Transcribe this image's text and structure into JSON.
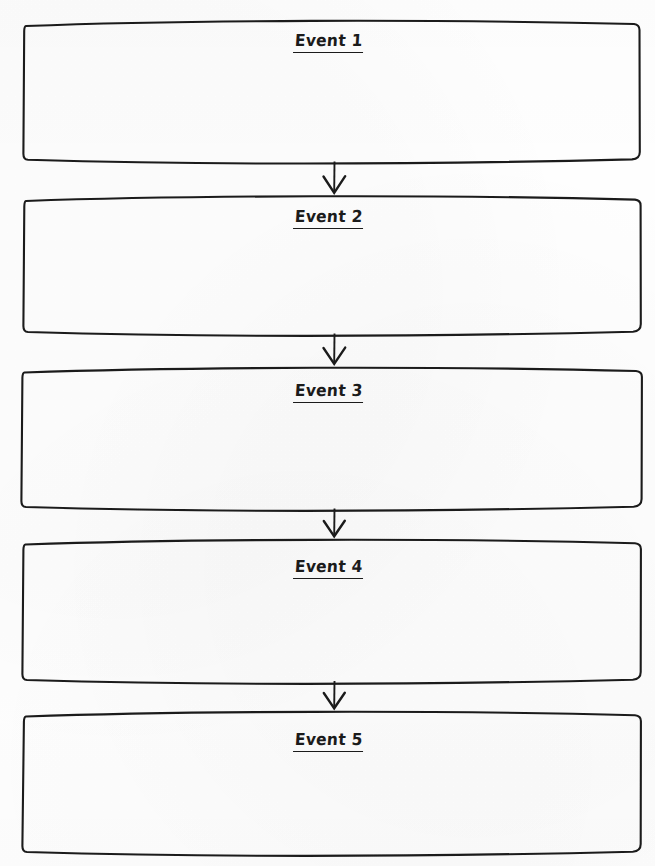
{
  "document": {
    "type": "sequence-chain-graphic-organizer",
    "orientation": "portrait",
    "background_color": "#ffffff",
    "ink_color": "#1b1b1b",
    "page_width": 655,
    "page_height": 866
  },
  "boxes": [
    {
      "id": "event-1",
      "label": "Event 1",
      "top": 22,
      "bottom": 161,
      "left": 24,
      "right": 640
    },
    {
      "id": "event-2",
      "label": "Event 2",
      "top": 197,
      "bottom": 333,
      "left": 24,
      "right": 641
    },
    {
      "id": "event-3",
      "label": "Event 3",
      "top": 368,
      "bottom": 508,
      "left": 22,
      "right": 642
    },
    {
      "id": "event-4",
      "label": "Event 4",
      "top": 540,
      "bottom": 681,
      "left": 23,
      "right": 641
    },
    {
      "id": "event-5",
      "label": "Event 5",
      "top": 712,
      "bottom": 853,
      "left": 24,
      "right": 641
    }
  ],
  "arrows": [
    {
      "id": "arrow-1-2",
      "from": "event-1",
      "to": "event-2",
      "direction": "down",
      "x": 334,
      "top": 162,
      "bottom": 195
    },
    {
      "id": "arrow-2-3",
      "from": "event-2",
      "to": "event-3",
      "direction": "down",
      "x": 334,
      "top": 334,
      "bottom": 366
    },
    {
      "id": "arrow-3-4",
      "from": "event-3",
      "to": "event-4",
      "direction": "down",
      "x": 334,
      "top": 509,
      "bottom": 538
    },
    {
      "id": "arrow-4-5",
      "from": "event-4",
      "to": "event-5",
      "direction": "down",
      "x": 334,
      "top": 682,
      "bottom": 710
    }
  ]
}
